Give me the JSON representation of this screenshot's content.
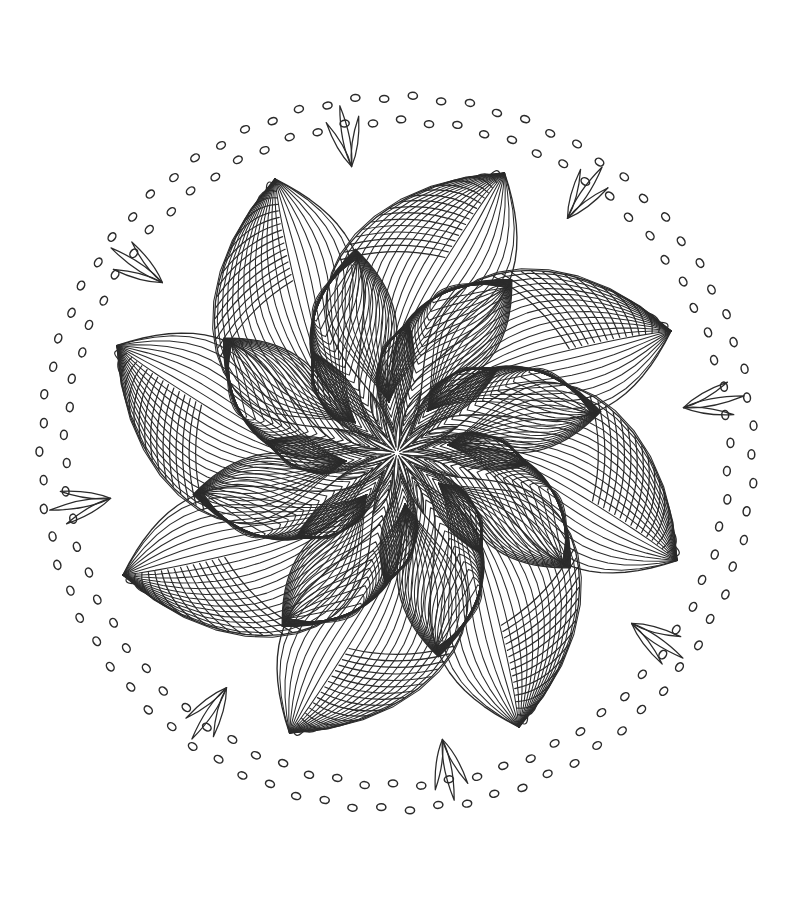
{
  "document": {
    "kind": "line-art-illustration",
    "subject": "floral mandala coloring page",
    "background_color": "#ffffff",
    "ink_color": "#2b2b2b",
    "canvas": {
      "width": 787,
      "height": 910
    }
  },
  "mandala": {
    "center": {
      "x": 397,
      "y": 453
    },
    "symmetry_fold": 8,
    "rotation_offset_deg": -9,
    "layers": [
      {
        "name": "outer-dot-ring",
        "type": "dotted-ring",
        "rings": 2,
        "radius_outer": 356,
        "radius_inner": 332,
        "dot_count_outer": 78,
        "dot_count_inner": 74,
        "dot_rx": 4.6,
        "dot_ry": 3.4,
        "stroke_width": 1.5,
        "filled": false
      },
      {
        "name": "outer-petal-ring",
        "type": "petal-ring",
        "count": 8,
        "hatch_style": "radial-lines",
        "hatch_count": 22,
        "radius_tip": 300,
        "radius_base": 24,
        "half_width_deg": 30,
        "stroke_width": 1.35
      },
      {
        "name": "outer-petal-cap",
        "type": "petal-cap-hatch",
        "count": 8,
        "hatch_style": "cross-arcs",
        "hatch_count": 16,
        "stroke_width": 1.2
      },
      {
        "name": "mid-petal-ring",
        "type": "petal-ring",
        "count": 8,
        "hatch_style": "nested-contours",
        "hatch_count": 17,
        "radius_tip": 208,
        "radius_base": 10,
        "half_width_deg": 23,
        "stroke_width": 1.3
      },
      {
        "name": "inner-petal-ring",
        "type": "petal-ring",
        "count": 8,
        "hatch_style": "nested-contours",
        "hatch_count": 13,
        "radius_tip": 132,
        "radius_base": 6,
        "half_width_deg": 14,
        "stroke_width": 1.25
      },
      {
        "name": "core-petal-ring",
        "type": "petal-ring",
        "count": 8,
        "hatch_style": "slim-outline",
        "hatch_count": 3,
        "radius_tip": 66,
        "radius_base": 3,
        "half_width_deg": 7,
        "stroke_width": 1.2
      },
      {
        "name": "spike-clusters",
        "type": "leaf-spikes",
        "count": 8,
        "spikes_per_cluster": 3,
        "radius_attach": 296,
        "spike_length": 62,
        "spike_half_width": 7,
        "spread_deg": 19,
        "stroke_width": 1.25
      }
    ]
  },
  "palette": {
    "paper": "#ffffff",
    "ink": "#2b2b2b",
    "ink_light": "#3a3a3a"
  },
  "chart_data": {
    "type": "scatter",
    "xlabel": "x (px)",
    "ylabel": "y (px)",
    "xlim": [
      0,
      787
    ],
    "ylim": [
      0,
      910
    ],
    "grid": false,
    "legend": "none",
    "series": [
      {
        "name": "outer-petal-tips",
        "values": [
          300,
          300,
          300,
          300,
          300,
          300,
          300,
          300
        ]
      },
      {
        "name": "mid-petal-tips",
        "values": [
          208,
          208,
          208,
          208,
          208,
          208,
          208,
          208
        ]
      },
      {
        "name": "inner-petal-tips",
        "values": [
          132,
          132,
          132,
          132,
          132,
          132,
          132,
          132
        ]
      },
      {
        "name": "core-petal-tips",
        "values": [
          66,
          66,
          66,
          66,
          66,
          66,
          66,
          66
        ]
      }
    ],
    "categories": [
      "0°",
      "45°",
      "90°",
      "135°",
      "180°",
      "225°",
      "270°",
      "315°"
    ]
  }
}
